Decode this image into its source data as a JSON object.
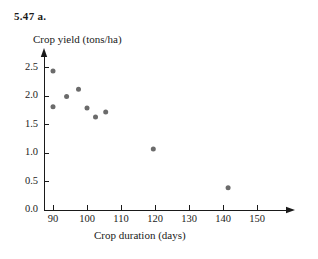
{
  "figure": {
    "problem_label": "5.47  a.",
    "background_color": "#ffffff",
    "axis_color": "#1a1a1a",
    "point_color": "#6b6b6b"
  },
  "chart_data": {
    "type": "scatter",
    "title": "5.47  a.",
    "xlabel": "Crop duration (days)",
    "ylabel": "Crop yield (tons/ha)",
    "xlim": [
      86,
      160
    ],
    "ylim": [
      0,
      2.75
    ],
    "xticks": [
      90,
      100,
      110,
      120,
      130,
      140,
      150
    ],
    "xticklabels": [
      "90",
      "100",
      "110",
      "120",
      "130",
      "140",
      "150"
    ],
    "yticks": [
      0.0,
      0.5,
      1.0,
      1.5,
      2.0,
      2.5
    ],
    "yticklabels": [
      "0.0",
      "0.5",
      "1.0",
      "1.5",
      "2.0",
      "2.5"
    ],
    "grid": false,
    "legend": false,
    "marker": "circle",
    "marker_color": "#6b6b6b",
    "marker_size": 4,
    "x": [
      90.0,
      90.0,
      94.0,
      97.5,
      100.0,
      102.5,
      105.5,
      119.5,
      141.5
    ],
    "y": [
      2.44,
      1.81,
      1.99,
      2.12,
      1.79,
      1.63,
      1.72,
      1.07,
      0.39
    ],
    "points": [
      {
        "x": 90.0,
        "y": 2.44
      },
      {
        "x": 90.0,
        "y": 1.81
      },
      {
        "x": 94.0,
        "y": 1.99
      },
      {
        "x": 97.5,
        "y": 2.12
      },
      {
        "x": 100.0,
        "y": 1.79
      },
      {
        "x": 102.5,
        "y": 1.63
      },
      {
        "x": 105.5,
        "y": 1.72
      },
      {
        "x": 119.5,
        "y": 1.07
      },
      {
        "x": 141.5,
        "y": 0.39
      }
    ]
  }
}
